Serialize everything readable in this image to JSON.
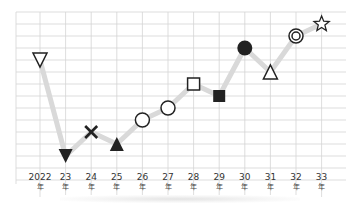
{
  "chart_data": {
    "type": "line",
    "title": "",
    "xlabel": "",
    "ylabel": "",
    "categories": [
      "2022年",
      "23年",
      "24年",
      "25年",
      "26年",
      "27年",
      "28年",
      "29年",
      "30年",
      "31年",
      "32年",
      "33年"
    ],
    "tick_labels": [
      {
        "num": "2022",
        "unit": "年"
      },
      {
        "num": "23",
        "unit": "年"
      },
      {
        "num": "24",
        "unit": "年"
      },
      {
        "num": "25",
        "unit": "年"
      },
      {
        "num": "26",
        "unit": "年"
      },
      {
        "num": "27",
        "unit": "年"
      },
      {
        "num": "28",
        "unit": "年"
      },
      {
        "num": "29",
        "unit": "年"
      },
      {
        "num": "30",
        "unit": "年"
      },
      {
        "num": "31",
        "unit": "年"
      },
      {
        "num": "32",
        "unit": "年"
      },
      {
        "num": "33",
        "unit": "年"
      }
    ],
    "series": [
      {
        "name": "fortune",
        "values": [
          11,
          3,
          5,
          4,
          6,
          7,
          9,
          8,
          12,
          10,
          13,
          14
        ],
        "markers": [
          "triangle-down-open",
          "triangle-down-filled",
          "cross",
          "triangle-up-filled",
          "circle-open",
          "circle-open",
          "square-open",
          "square-filled",
          "circle-filled",
          "triangle-up-open",
          "double-circle",
          "star-open"
        ]
      }
    ],
    "ylim": [
      0,
      15
    ],
    "grid": true,
    "legend": null,
    "colors": {
      "line": "#d9d9d9",
      "grid": "#d4d4d4",
      "marker": "#222222"
    }
  }
}
